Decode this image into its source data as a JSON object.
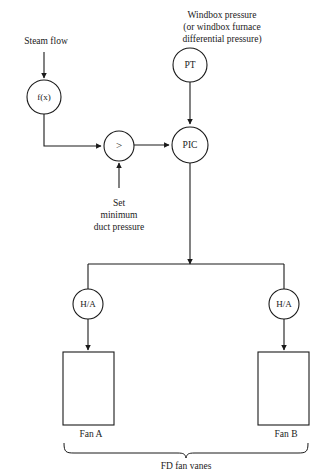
{
  "diagram": {
    "title_text": "FD fan vanes",
    "type": "control-loop-diagram",
    "background_color": "#ffffff",
    "line_color": "#1a1a1a"
  },
  "labels": {
    "steam_flow": "Steam flow",
    "windbox_line1": "Windbox pressure",
    "windbox_line2": "(or windbox furnace",
    "windbox_line3": "differential pressure)",
    "set_line1": "Set",
    "set_line2": "minimum",
    "set_line3": "duct pressure",
    "fan_a": "Fan A",
    "fan_b": "Fan B",
    "fd_fan_vanes": "FD fan vanes"
  },
  "nodes": {
    "function_generator": {
      "label": "f(x)",
      "cx": 44,
      "cy": 97,
      "r": 17
    },
    "comparator": {
      "label": ">",
      "cx": 119,
      "cy": 146,
      "r": 15
    },
    "pressure_transmitter": {
      "label": "PT",
      "cx": 190,
      "cy": 65,
      "r": 17
    },
    "pressure_controller": {
      "label": "PIC",
      "cx": 190,
      "cy": 145,
      "r": 18
    },
    "hand_auto_a": {
      "label": "H/A",
      "cx": 88,
      "cy": 304,
      "r": 15
    },
    "hand_auto_b": {
      "label": "H/A",
      "cx": 284,
      "cy": 304,
      "r": 15
    }
  },
  "blocks": {
    "fan_a_box": {
      "x": 63,
      "y": 352,
      "w": 51,
      "h": 73
    },
    "fan_b_box": {
      "x": 258,
      "y": 352,
      "w": 51,
      "h": 73
    }
  }
}
